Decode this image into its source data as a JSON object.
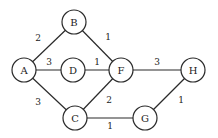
{
  "graph": {
    "nodes": [
      {
        "id": "A",
        "label": "A",
        "x": 24,
        "y": 70
      },
      {
        "id": "B",
        "label": "B",
        "x": 74,
        "y": 22
      },
      {
        "id": "D",
        "label": "D",
        "x": 73,
        "y": 70
      },
      {
        "id": "F",
        "label": "F",
        "x": 121,
        "y": 70
      },
      {
        "id": "H",
        "label": "H",
        "x": 193,
        "y": 70
      },
      {
        "id": "C",
        "label": "C",
        "x": 75,
        "y": 118
      },
      {
        "id": "G",
        "label": "G",
        "x": 145,
        "y": 118
      }
    ],
    "edges": [
      {
        "from": "A",
        "to": "B",
        "weight": "2",
        "lx": 38,
        "ly": 38
      },
      {
        "from": "B",
        "to": "F",
        "weight": "1",
        "lx": 108,
        "ly": 37
      },
      {
        "from": "A",
        "to": "D",
        "weight": "3",
        "lx": 49,
        "ly": 62
      },
      {
        "from": "D",
        "to": "F",
        "weight": "1",
        "lx": 97,
        "ly": 62
      },
      {
        "from": "F",
        "to": "H",
        "weight": "3",
        "lx": 157,
        "ly": 62
      },
      {
        "from": "A",
        "to": "C",
        "weight": "3",
        "lx": 38,
        "ly": 102
      },
      {
        "from": "C",
        "to": "F",
        "weight": "2",
        "lx": 109,
        "ly": 100
      },
      {
        "from": "C",
        "to": "G",
        "weight": "1",
        "lx": 110,
        "ly": 126
      },
      {
        "from": "G",
        "to": "H",
        "weight": "1",
        "lx": 181,
        "ly": 100
      }
    ],
    "node_radius": 12
  }
}
